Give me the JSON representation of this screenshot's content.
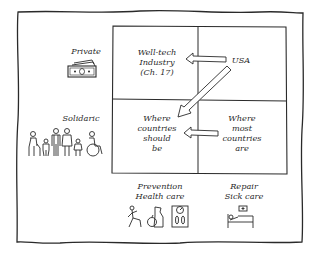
{
  "diagram": {
    "type": "2x2-matrix",
    "outer_frame": true,
    "quadrants": {
      "top_left": {
        "lines": [
          "Well-tech",
          "Industry",
          "(Ch. 17)"
        ]
      },
      "top_right": {
        "lines": [
          "USA"
        ]
      },
      "bottom_left": {
        "lines": [
          "Where",
          "countries",
          "should",
          "be"
        ]
      },
      "bottom_right": {
        "lines": [
          "Where",
          "most",
          "countries",
          "are"
        ]
      }
    },
    "row_labels": {
      "top": {
        "label": "Private",
        "icon": "money-icon"
      },
      "bottom": {
        "label": "Solidaric",
        "icon": "people-family-icon"
      }
    },
    "column_labels": {
      "left": {
        "line1": "Prevention",
        "line2": "Health care",
        "icons": [
          "exercise-icon",
          "healthy-food-icon",
          "scale-icon"
        ]
      },
      "right": {
        "line1": "Repair",
        "line2": "Sick care",
        "icons": [
          "hospital-bed-icon"
        ]
      }
    },
    "arrows": [
      {
        "from": "top_right",
        "to": "top_left"
      },
      {
        "from": "top_right",
        "to": "bottom_left"
      },
      {
        "from": "bottom_right",
        "to": "bottom_left"
      }
    ],
    "colors": {
      "ink": "#2a2a2a",
      "background": "#ffffff"
    }
  }
}
